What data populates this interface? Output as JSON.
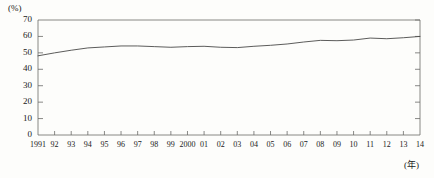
{
  "chart_data": {
    "type": "line",
    "title": "",
    "subtitle": "",
    "xlabel": "(年)",
    "ylabel": "(%)",
    "ylim": [
      0,
      70
    ],
    "ytick_values": [
      0,
      10,
      20,
      30,
      40,
      50,
      60,
      70
    ],
    "ytick_labels": [
      "0",
      "10",
      "20",
      "30",
      "40",
      "50",
      "60",
      "70"
    ],
    "grid": false,
    "legend": "none",
    "categories": [
      "1991",
      "92",
      "93",
      "94",
      "95",
      "96",
      "97",
      "98",
      "99",
      "2000",
      "01",
      "02",
      "03",
      "04",
      "05",
      "06",
      "07",
      "08",
      "09",
      "10",
      "11",
      "12",
      "13",
      "14"
    ],
    "x": [
      1991,
      1992,
      1993,
      1994,
      1995,
      1996,
      1997,
      1998,
      1999,
      2000,
      2001,
      2002,
      2003,
      2004,
      2005,
      2006,
      2007,
      2008,
      2009,
      2010,
      2011,
      2012,
      2013,
      2014
    ],
    "series": [
      {
        "name": "rate",
        "values": [
          48.2,
          50.0,
          51.6,
          53.0,
          53.6,
          54.2,
          54.2,
          53.8,
          53.4,
          53.8,
          54.0,
          53.4,
          53.2,
          54.0,
          54.6,
          55.4,
          56.6,
          57.6,
          57.4,
          57.8,
          59.0,
          58.6,
          59.2,
          60.0
        ]
      }
    ],
    "line_color": "#4a4a48",
    "axis_color": "#6b6b68"
  },
  "axis": {
    "y_unit": "(%)",
    "x_unit": "(年)"
  }
}
